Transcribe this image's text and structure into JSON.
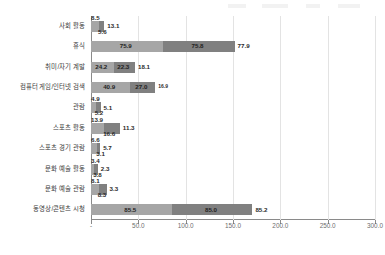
{
  "chart_data": {
    "type": "bar",
    "orientation": "horizontal",
    "stacked": true,
    "title": "",
    "subtitle": "",
    "xlabel": "",
    "ylabel": "",
    "xlim": [
      0,
      300
    ],
    "grid": true,
    "legend_position": "top",
    "xticks": [
      "-",
      "50.0",
      "100.0",
      "150.0",
      "200.0",
      "250.0",
      "300.0"
    ],
    "xtick_values": [
      0,
      50,
      100,
      150,
      200,
      250,
      300
    ],
    "categories": [
      "사회 활동",
      "휴식",
      "취미/자기 계발",
      "컴퓨터 게임/인터넷 검색",
      "관람",
      "스포츠 활동",
      "스포츠 경기 관람",
      "문화 예술 활동",
      "문화 예술 관람",
      "동영상/콘텐츠 시청"
    ],
    "series": [
      {
        "name": "series-1",
        "color": "#a6a6a6",
        "values": [
          8.5,
          75.9,
          24.2,
          40.9,
          4.9,
          13.9,
          6.6,
          3.4,
          8.1,
          85.5
        ]
      },
      {
        "name": "series-2",
        "color": "#808080",
        "values": [
          5.6,
          75.8,
          22.3,
          27.0,
          5.2,
          16.6,
          3.1,
          3.8,
          8.3,
          85.0
        ]
      },
      {
        "name": "series-3",
        "color": "#ffffff",
        "values": [
          13.1,
          77.9,
          18.1,
          16.9,
          5.1,
          11.3,
          5.7,
          2.3,
          3.3,
          85.2
        ]
      }
    ],
    "data_labels": [
      [
        "8.5",
        "5.6",
        "13.1"
      ],
      [
        "75.9",
        "75.8",
        "77.9"
      ],
      [
        "24.2",
        "22.3",
        "18.1"
      ],
      [
        "40.9",
        "27.0",
        "16.9"
      ],
      [
        "4.9",
        "5.2",
        "5.1"
      ],
      [
        "13.9",
        "16.6",
        "11.3"
      ],
      [
        "6.6",
        "3.1",
        "5.7"
      ],
      [
        "3.4",
        "3.8",
        "2.3"
      ],
      [
        "8.1",
        "8.3",
        "3.3"
      ],
      [
        "85.5",
        "85.0",
        "85.2"
      ]
    ]
  }
}
